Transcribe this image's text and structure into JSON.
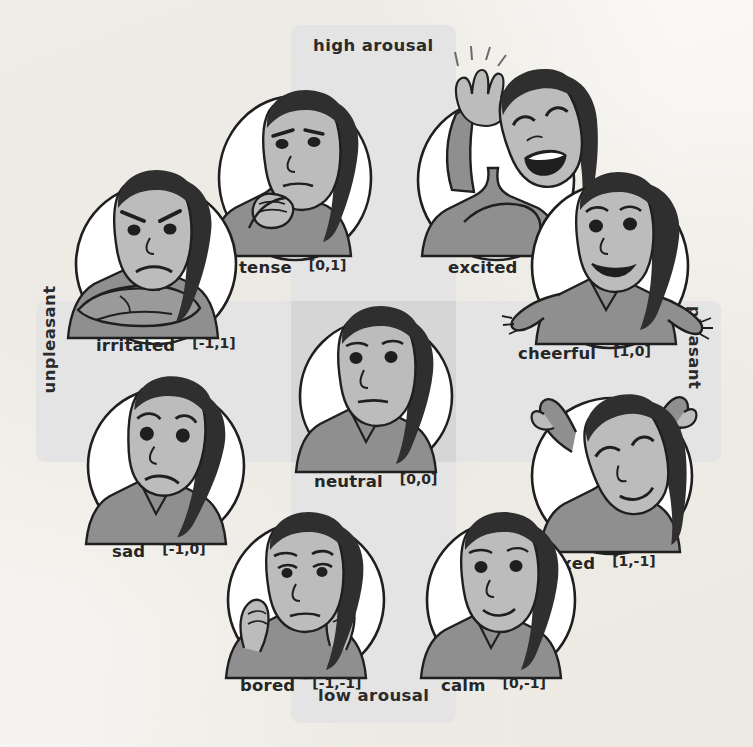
{
  "diagram": {
    "axes": {
      "vertical_top": "high arousal",
      "vertical_bottom": "low arousal",
      "horizontal_left": "unpleasant",
      "horizontal_right": "pleasant"
    },
    "colors": {
      "band": "#e4e4e4",
      "band_overlap": "#d6d6d6",
      "page": "#f7f5f1",
      "ink": "#262626",
      "skin": "#b9b9b9",
      "shirt": "#9a9a9a",
      "hair": "#2f2f2f",
      "oval": "#ffffff"
    }
  },
  "emotions": [
    {
      "id": "tense",
      "name": "tense",
      "coord": "[0,1]",
      "valence": 0,
      "arousal": 1
    },
    {
      "id": "excited",
      "name": "excited",
      "coord": "[1,1]",
      "valence": 1,
      "arousal": 1
    },
    {
      "id": "irritated",
      "name": "irritated",
      "coord": "[-1,1]",
      "valence": -1,
      "arousal": 1
    },
    {
      "id": "cheerful",
      "name": "cheerful",
      "coord": "[1,0]",
      "valence": 1,
      "arousal": 0
    },
    {
      "id": "neutral",
      "name": "neutral",
      "coord": "[0,0]",
      "valence": 0,
      "arousal": 0
    },
    {
      "id": "sad",
      "name": "sad",
      "coord": "[-1,0]",
      "valence": -1,
      "arousal": 0
    },
    {
      "id": "relaxed",
      "name": "relaxed",
      "coord": "[1,-1]",
      "valence": 1,
      "arousal": -1
    },
    {
      "id": "bored",
      "name": "bored",
      "coord": "[-1,-1]",
      "valence": -1,
      "arousal": -1
    },
    {
      "id": "calm",
      "name": "calm",
      "coord": "[0,-1]",
      "valence": 0,
      "arousal": -1
    }
  ]
}
